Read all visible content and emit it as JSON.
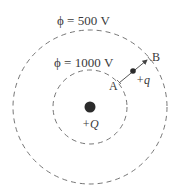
{
  "diagram": {
    "equipotentials": [
      {
        "label": "ϕ = 500 V",
        "radius": 77
      },
      {
        "label": "ϕ = 1000 V",
        "radius": 37
      }
    ],
    "source_charge": {
      "label": "+Q"
    },
    "test_charge": {
      "label": "+q"
    },
    "points": {
      "A": "A",
      "B": "B"
    },
    "colors": {
      "line": "#555555",
      "charge": "#2b2b2b",
      "text": "#3a3a3a"
    }
  }
}
